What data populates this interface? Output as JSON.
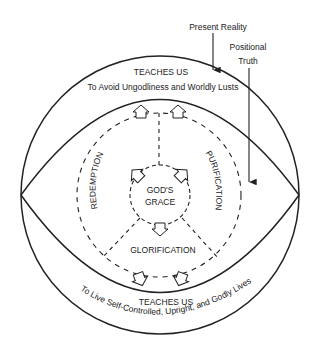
{
  "labels": {
    "present_reality": "Present Reality",
    "positional_line1": "Positional",
    "positional_line2": "Truth",
    "teaches_top": "TEACHES US",
    "avoid": "To Avoid Ungodliness and Worldly Lusts",
    "redemption": "REDEMPTION",
    "purification": "PURIFICATION",
    "gods": "GOD'S",
    "grace": "GRACE",
    "glorification": "GLORIFICATION",
    "teaches_bottom": "TEACHES US",
    "live": "To Live Self-Controlled, Upright, and Godly Lives"
  },
  "colors": {
    "line": "#222222",
    "background": "#ffffff"
  }
}
